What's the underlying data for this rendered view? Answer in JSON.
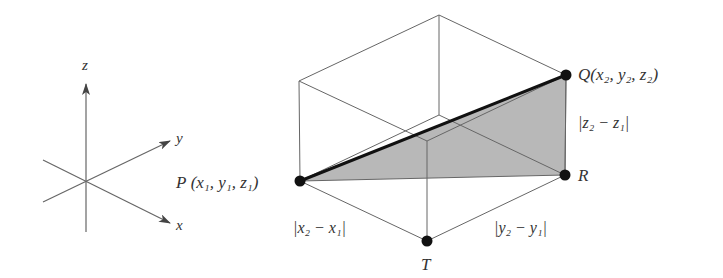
{
  "colors": {
    "line": "#555555",
    "thick_line": "#111111",
    "point": "#111111",
    "shade": "#b5b5b5",
    "text": "#333333"
  },
  "axes": {
    "x_label": "x",
    "y_label": "y",
    "z_label": "z"
  },
  "points": {
    "P": {
      "name": "P",
      "coords_text": "(x₁, y₁, z₁)"
    },
    "Q": {
      "name": "Q",
      "coords_text": "(x₂, y₂, z₂)"
    },
    "R": {
      "name": "R"
    },
    "T": {
      "name": "T"
    }
  },
  "distances": {
    "x": "|x₂ − x₁|",
    "y": "|y₂ − y₁|",
    "z": "|z₂ − z₁|"
  }
}
